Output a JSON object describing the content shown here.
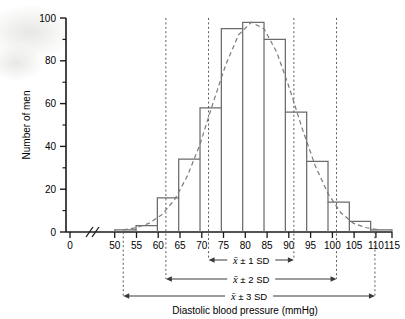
{
  "chart_data": {
    "type": "bar",
    "title": "",
    "subtitle": "",
    "xlabel": "Diastolic blood pressure (mmHg)",
    "ylabel": "Number of men",
    "xlim": [
      50,
      115
    ],
    "ylim": [
      0,
      100
    ],
    "grid": false,
    "legend": "none",
    "axis_break": {
      "present": true,
      "symbol": "//",
      "between": [
        0,
        50
      ]
    },
    "bin_width": 5,
    "bin_edges": [
      50,
      55,
      60,
      65,
      70,
      75,
      80,
      85,
      90,
      95,
      100,
      105,
      110,
      115
    ],
    "categories": [
      "50-55",
      "55-60",
      "60-65",
      "65-70",
      "70-75",
      "75-80",
      "80-85",
      "85-90",
      "90-95",
      "95-100",
      "100-105",
      "105-110",
      "110-115"
    ],
    "values": [
      1,
      3,
      16,
      34,
      58,
      95,
      98,
      90,
      56,
      33,
      14,
      5,
      1
    ],
    "series": [
      {
        "name": "Number of men",
        "type": "bar",
        "values": [
          1,
          3,
          16,
          34,
          58,
          95,
          98,
          90,
          56,
          33,
          14,
          5,
          1
        ]
      },
      {
        "name": "Fitted normal curve",
        "type": "line",
        "style": "dashed",
        "x": [
          52,
          55,
          58,
          61,
          64,
          67,
          70,
          73,
          76,
          79,
          82,
          85,
          88,
          91,
          94,
          97,
          100,
          103,
          106,
          109,
          112
        ],
        "y": [
          1,
          2,
          4,
          8,
          15,
          26,
          41,
          60,
          78,
          92,
          98,
          95,
          84,
          67,
          48,
          31,
          18,
          9,
          4,
          2,
          1
        ]
      }
    ],
    "x_ticks": [
      0,
      50,
      55,
      60,
      65,
      70,
      75,
      80,
      85,
      90,
      95,
      100,
      105,
      110,
      115
    ],
    "x_tick_labels": [
      "0",
      "50",
      "55",
      "60",
      "65",
      "70",
      "75",
      "80",
      "85",
      "90",
      "95",
      "100",
      "105",
      "110",
      "115"
    ],
    "y_ticks": [
      0,
      20,
      40,
      60,
      80,
      100
    ],
    "y_tick_labels": [
      "0",
      "20",
      "40",
      "60",
      "80",
      "100"
    ],
    "y_minor_ticks": [
      10,
      30,
      50,
      70,
      90
    ],
    "annotations": [
      {
        "name": "sd1",
        "label": "x̄ ± 1 SD",
        "from": 72,
        "to": 92,
        "arrows": "both",
        "droplines": true
      },
      {
        "name": "sd2",
        "label": "x̄ ± 2 SD",
        "from": 62,
        "to": 102,
        "arrows": "both",
        "droplines": true
      },
      {
        "name": "sd3",
        "label": "x̄ ± 3 SD",
        "from": 52,
        "to": 111,
        "arrows": "both",
        "droplines": true
      }
    ]
  },
  "axes": {
    "y_title": "Number of men",
    "x_title": "Diastolic blood pressure (mmHg)",
    "y_labels": {
      "t100": "100",
      "t80": "80",
      "t60": "60",
      "t40": "40",
      "t20": "20",
      "t0": "0"
    },
    "x_labels": {
      "zero": "0",
      "v50": "50",
      "v55": "55",
      "v60": "60",
      "v65": "65",
      "v70": "70",
      "v75": "75",
      "v80": "80",
      "v85": "85",
      "v90": "90",
      "v95": "95",
      "v100": "100",
      "v105": "105",
      "v110": "110",
      "v115": "115"
    }
  },
  "sd_brackets": {
    "one": {
      "xbar": "x̄",
      "text": " ± 1 SD"
    },
    "two": {
      "xbar": "x̄",
      "text": " ± 2 SD"
    },
    "three": {
      "xbar": "x̄",
      "text": " ± 3 SD"
    }
  },
  "colors": {
    "axis": "#1a1a1a",
    "bar_stroke": "#6b6b6b",
    "curve": "#7a7a7a",
    "annotation": "#3a3a3a",
    "dropline": "#5a5a5a",
    "background": "#ffffff"
  }
}
